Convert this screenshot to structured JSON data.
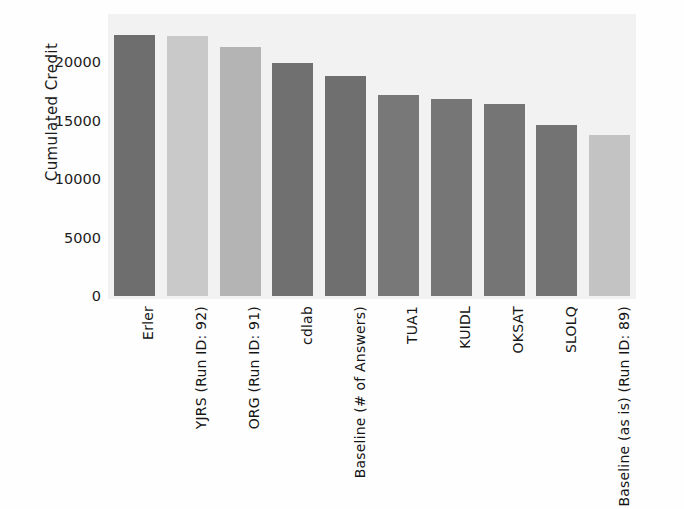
{
  "chart_data": {
    "type": "bar",
    "title": "",
    "xlabel": "",
    "ylabel": "Cumulated Credit",
    "categories": [
      "Erler",
      "YJRS (Run ID: 92)",
      "ORG (Run ID: 91)",
      "cdlab",
      "Baseline (# of Answers)",
      "TUA1",
      "KUIDL",
      "OKSAT",
      "SLOLQ",
      "Baseline (as is) (Run ID: 89)"
    ],
    "values": [
      22300,
      22250,
      21300,
      19900,
      18800,
      17150,
      16800,
      16400,
      14650,
      13750
    ],
    "bar_colors": [
      "#6e6e6e",
      "#c9c9c9",
      "#b4b4b4",
      "#707070",
      "#6f6f6f",
      "#787878",
      "#767676",
      "#757575",
      "#737373",
      "#c3c3c3"
    ],
    "ylim": [
      0,
      23400
    ],
    "yticks": [
      0,
      5000,
      10000,
      15000,
      20000
    ],
    "ytick_labels": [
      "0",
      "5000",
      "10000",
      "15000",
      "20000"
    ],
    "grid": false,
    "legend": null,
    "plot_background": "#f2f2f2"
  }
}
